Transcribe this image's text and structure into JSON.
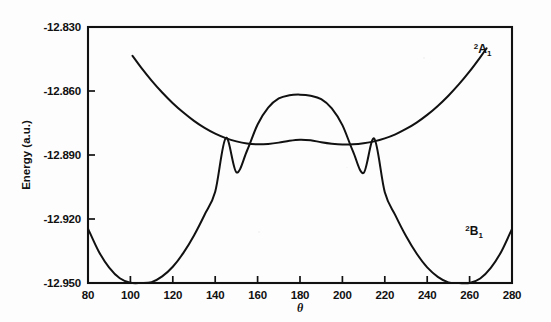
{
  "figure": {
    "title": "",
    "background_color": "#fdfdfd",
    "ink_color": "#111111"
  },
  "chart_data": {
    "type": "line",
    "title": "",
    "subtitle": "",
    "xlabel": "θ",
    "ylabel": "Energy (a.u.)",
    "xlim": [
      80,
      280
    ],
    "ylim": [
      -12.95,
      -12.83
    ],
    "xticks": [
      80,
      100,
      120,
      140,
      160,
      180,
      200,
      220,
      240,
      260,
      280
    ],
    "xticklabels": [
      "80",
      "100",
      "120",
      "140",
      "160",
      "180",
      "200",
      "220",
      "240",
      "260",
      "280"
    ],
    "yticks": [
      -12.95,
      -12.92,
      -12.89,
      -12.86,
      -12.83
    ],
    "yticklabels": [
      "-12.950",
      "-12.920",
      "-12.890",
      "-12.860",
      "-12.830"
    ],
    "grid": false,
    "legend": "inline-annotations",
    "tick_direction": "in",
    "frame": "box",
    "series": [
      {
        "name": "2A1",
        "label_parts": {
          "sup": "2",
          "base": "A",
          "sub": "1"
        },
        "label_x": 262,
        "label_y": -12.842,
        "color": "#111111",
        "x": [
          101,
          105,
          110,
          115,
          120,
          125,
          130,
          135,
          140,
          145,
          150,
          155,
          160,
          165,
          170,
          175,
          180,
          185,
          190,
          195,
          200,
          205,
          210,
          215,
          220,
          225,
          230,
          235,
          240,
          245,
          250,
          255,
          260,
          265,
          268
        ],
        "y": [
          -12.8435,
          -12.8489,
          -12.8551,
          -12.8607,
          -12.8657,
          -12.8701,
          -12.874,
          -12.8773,
          -12.88,
          -12.8821,
          -12.8836,
          -12.8846,
          -12.885,
          -12.8848,
          -12.8842,
          -12.8833,
          -12.8828,
          -12.8831,
          -12.884,
          -12.8847,
          -12.8851,
          -12.885,
          -12.8845,
          -12.8836,
          -12.8822,
          -12.8803,
          -12.8778,
          -12.8748,
          -12.8712,
          -12.867,
          -12.8622,
          -12.8568,
          -12.8508,
          -12.8442,
          -12.84
        ]
      },
      {
        "name": "2B1",
        "label_parts": {
          "sup": "2",
          "base": "B",
          "sub": "1"
        },
        "label_x": 258,
        "label_y": -12.9275,
        "color": "#111111",
        "x": [
          80,
          85,
          90,
          95,
          100,
          105,
          110,
          115,
          120,
          125,
          130,
          135,
          140,
          145,
          150,
          155,
          160,
          165,
          170,
          175,
          180,
          185,
          190,
          195,
          200,
          205,
          210,
          215,
          220,
          225,
          230,
          235,
          240,
          245,
          250,
          255,
          260,
          265,
          270,
          275,
          280
        ],
        "y": [
          -12.9245,
          -12.9351,
          -12.9428,
          -12.9478,
          -12.9499,
          -12.9503,
          -12.9496,
          -12.9469,
          -12.9424,
          -12.9359,
          -12.9277,
          -12.918,
          -12.9072,
          -12.882,
          -12.8981,
          -12.888,
          -12.8757,
          -12.8678,
          -12.8635,
          -12.862,
          -12.8617,
          -12.8622,
          -12.8638,
          -12.8681,
          -12.876,
          -12.8883,
          -12.8984,
          -12.8823,
          -12.9075,
          -12.9183,
          -12.928,
          -12.9362,
          -12.9427,
          -12.9471,
          -12.9497,
          -12.9504,
          -12.95,
          -12.9479,
          -12.9429,
          -12.9352,
          -12.9246
        ]
      }
    ]
  }
}
